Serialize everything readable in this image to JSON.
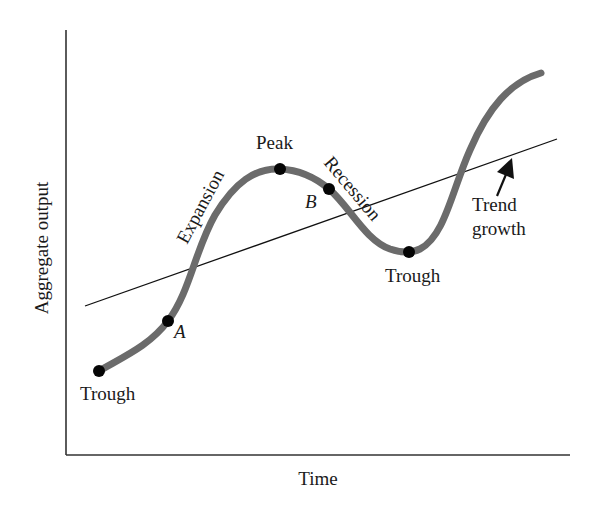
{
  "diagram": {
    "axes": {
      "x_label": "Time",
      "y_label": "Aggregate output"
    },
    "curve": {
      "name": "Aggregate output over time",
      "color": "#6b6b6b"
    },
    "trend_line": {
      "label_line1": "Trend",
      "label_line2": "growth",
      "color": "#111111"
    },
    "phases": {
      "expansion": "Expansion",
      "recession": "Recession"
    },
    "points": [
      {
        "id": "trough-1",
        "label": "Trough"
      },
      {
        "id": "point-a",
        "label": "A"
      },
      {
        "id": "peak",
        "label": "Peak"
      },
      {
        "id": "point-b",
        "label": "B"
      },
      {
        "id": "trough-2",
        "label": "Trough"
      }
    ]
  }
}
